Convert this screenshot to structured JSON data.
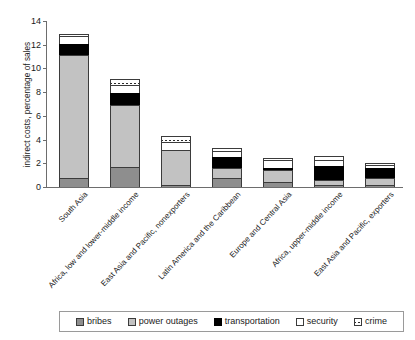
{
  "chart_data": {
    "type": "bar",
    "subtype": "stacked-vertical",
    "title": "",
    "xlabel": "",
    "ylabel": "indirect costs, percentage of sales",
    "ylim": [
      0,
      14
    ],
    "yticks": [
      0,
      2,
      4,
      6,
      8,
      10,
      12,
      14
    ],
    "grid": false,
    "legend_position": "bottom",
    "categories": [
      "South Asia",
      "Africa, low and lower-middle income",
      "East Asia and Pacific, nonexporters",
      "Latin America and the Caribbean",
      "Europe and Central Asia",
      "Africa, upper-middle income",
      "East Asia and Pacific, exporters"
    ],
    "series": [
      {
        "name": "bribes",
        "color": "#8e8e8e",
        "values": [
          0.8,
          1.7,
          0.2,
          0.8,
          0.4,
          0.2,
          0.2
        ]
      },
      {
        "name": "power outages",
        "color": "#c2c2c2",
        "values": [
          10.3,
          5.2,
          2.9,
          0.8,
          1.0,
          0.4,
          0.6
        ]
      },
      {
        "name": "transportation",
        "color": "#000000",
        "values": [
          1.0,
          1.0,
          0.0,
          0.9,
          0.15,
          1.2,
          0.8
        ]
      },
      {
        "name": "security",
        "color": "#ffffff",
        "values": [
          0.6,
          0.7,
          0.7,
          0.5,
          0.7,
          0.5,
          0.3
        ]
      },
      {
        "name": "crime",
        "color": "#ffffff-hatched",
        "values": [
          0.2,
          0.5,
          0.5,
          0.3,
          0.15,
          0.3,
          0.1
        ]
      }
    ],
    "totals": [
      12.9,
      9.1,
      4.3,
      3.3,
      2.4,
      2.6,
      2.0
    ]
  },
  "legend": {
    "items": [
      {
        "label": "bribes",
        "swatch": "bribes-swatch-icon"
      },
      {
        "label": "power outages",
        "swatch": "power-outages-swatch-icon"
      },
      {
        "label": "transportation",
        "swatch": "transportation-swatch-icon"
      },
      {
        "label": "security",
        "swatch": "security-swatch-icon"
      },
      {
        "label": "crime",
        "swatch": "crime-swatch-icon"
      }
    ]
  }
}
